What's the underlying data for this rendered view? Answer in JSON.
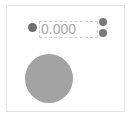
{
  "input": {
    "value": "0.000"
  },
  "icons": {
    "left": "dot-icon",
    "increment": "plus-icon",
    "decrement": "minus-icon"
  },
  "colors": {
    "frame_border": "#e4e4e4",
    "dot": "#6f6f6f",
    "buttons": "#7b7b7b",
    "input_text": "#a8a8a8",
    "circle": "#a3a3a3"
  }
}
